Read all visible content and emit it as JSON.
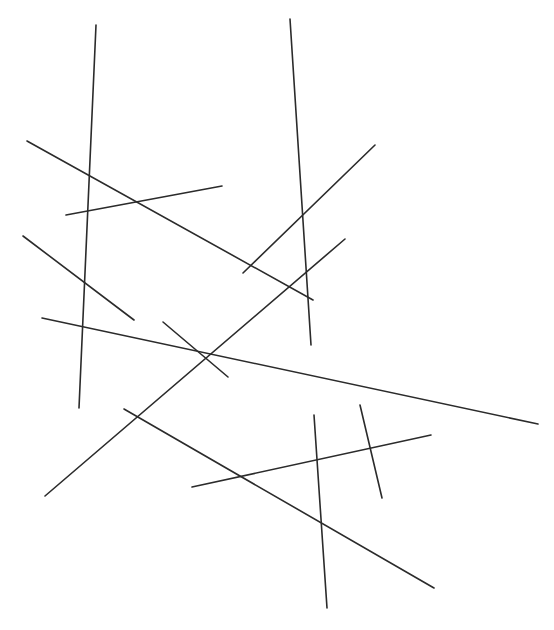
{
  "figure": {
    "width": 554,
    "height": 630,
    "background_color": "#ffffff",
    "line_color": "#2b2b2b",
    "line_width": 1.6,
    "segment_count": 12
  },
  "chart_data": {
    "type": "scatter",
    "xlabel": "",
    "ylabel": "",
    "xlim": [
      0,
      554
    ],
    "ylim": [
      0,
      630
    ],
    "grid": false,
    "legend": "none",
    "segments": [
      {
        "name": "segment-1",
        "label": "steep-left-vertical",
        "x1": 96,
        "y1": 25,
        "x2": 79,
        "y2": 408
      },
      {
        "name": "segment-2",
        "label": "steep-mid-vertical",
        "x1": 290,
        "y1": 19,
        "x2": 311,
        "y2": 345
      },
      {
        "name": "segment-3",
        "label": "upper-left-long-diagonal",
        "x1": 27,
        "y1": 141,
        "x2": 313,
        "y2": 300
      },
      {
        "name": "segment-4",
        "label": "upper-horizontal-short",
        "x1": 66,
        "y1": 215,
        "x2": 222,
        "y2": 186
      },
      {
        "name": "segment-5",
        "label": "rising-right-diagonal",
        "x1": 243,
        "y1": 273,
        "x2": 375,
        "y2": 145
      },
      {
        "name": "segment-6",
        "label": "mid-left-descending",
        "x1": 23,
        "y1": 236,
        "x2": 134,
        "y2": 320
      },
      {
        "name": "segment-7",
        "label": "long-descending-main",
        "x1": 42,
        "y1": 318,
        "x2": 538,
        "y2": 424
      },
      {
        "name": "segment-8",
        "label": "long-rising-diagonal",
        "x1": 45,
        "y1": 496,
        "x2": 345,
        "y2": 239
      },
      {
        "name": "segment-9",
        "label": "long-falling-diagonal",
        "x1": 124,
        "y1": 409,
        "x2": 434,
        "y2": 588
      },
      {
        "name": "segment-10",
        "label": "short-rising-mid",
        "x1": 163,
        "y1": 322,
        "x2": 228,
        "y2": 377
      },
      {
        "name": "segment-11",
        "label": "lower-vertical-long",
        "x1": 314,
        "y1": 415,
        "x2": 327,
        "y2": 608
      },
      {
        "name": "segment-12",
        "label": "lower-vertical-short",
        "x1": 360,
        "y1": 405,
        "x2": 382,
        "y2": 498
      },
      {
        "name": "segment-13",
        "label": "lower-horizontal-right",
        "x1": 192,
        "y1": 487,
        "x2": 431,
        "y2": 435
      }
    ]
  }
}
